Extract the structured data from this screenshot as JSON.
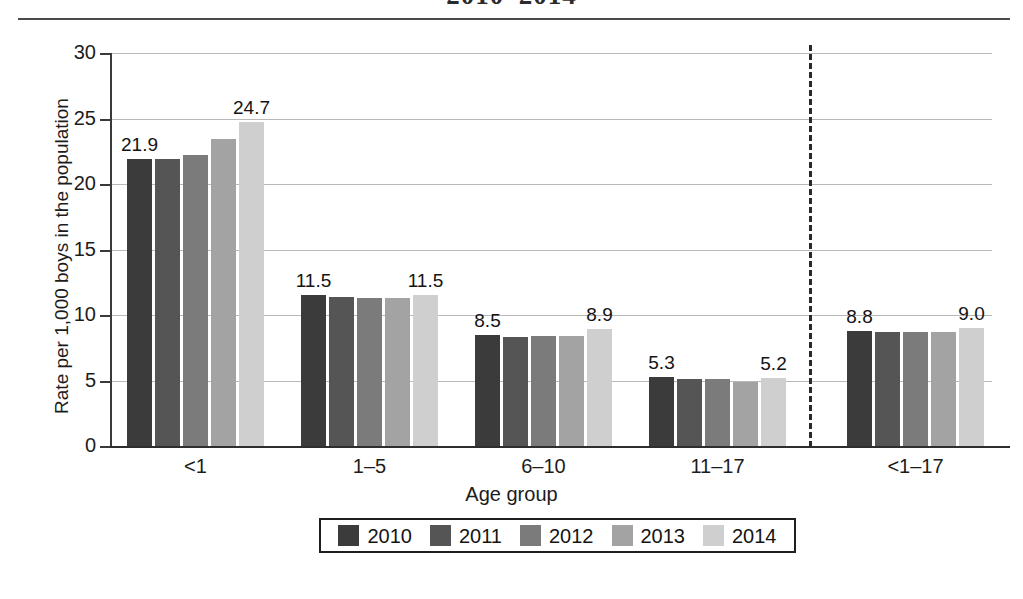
{
  "chart_data": {
    "type": "bar",
    "title": "2010–2014",
    "xlabel": "Age group",
    "ylabel": "Rate per 1,000 boys in the population",
    "categories": [
      "<1",
      "1–5",
      "6–10",
      "11–17",
      "<1–17"
    ],
    "series": [
      {
        "name": "2010",
        "color": "#3b3b3b",
        "values": [
          21.9,
          11.5,
          8.5,
          5.3,
          8.8
        ]
      },
      {
        "name": "2011",
        "color": "#555555",
        "values": [
          21.9,
          11.4,
          8.3,
          5.1,
          8.7
        ]
      },
      {
        "name": "2012",
        "color": "#7b7b7b",
        "values": [
          22.2,
          11.3,
          8.4,
          5.1,
          8.7
        ]
      },
      {
        "name": "2013",
        "color": "#a3a3a3",
        "values": [
          23.4,
          11.3,
          8.4,
          4.9,
          8.7
        ]
      },
      {
        "name": "2014",
        "color": "#cfcfcf",
        "values": [
          24.7,
          11.5,
          8.9,
          5.2,
          9.0
        ]
      }
    ],
    "ylim": [
      0,
      30
    ],
    "yticks": [
      0,
      5,
      10,
      15,
      20,
      25,
      30
    ],
    "ytick_labels": [
      "0",
      "5",
      "10",
      "15",
      "20",
      "25",
      "30"
    ],
    "grid": true,
    "legend_position": "bottom",
    "point_labels": [
      {
        "group": 0,
        "series": 0,
        "text": "21.9"
      },
      {
        "group": 0,
        "series": 4,
        "text": "24.7"
      },
      {
        "group": 1,
        "series": 0,
        "text": "11.5"
      },
      {
        "group": 1,
        "series": 4,
        "text": "11.5"
      },
      {
        "group": 2,
        "series": 0,
        "text": "8.5"
      },
      {
        "group": 2,
        "series": 4,
        "text": "8.9"
      },
      {
        "group": 3,
        "series": 0,
        "text": "5.3"
      },
      {
        "group": 3,
        "series": 4,
        "text": "5.2"
      },
      {
        "group": 4,
        "series": 0,
        "text": "8.8"
      },
      {
        "group": 4,
        "series": 4,
        "text": "9.0"
      }
    ],
    "annotations": [
      {
        "type": "dashed-vertical-separator",
        "after_group": 3
      }
    ]
  }
}
